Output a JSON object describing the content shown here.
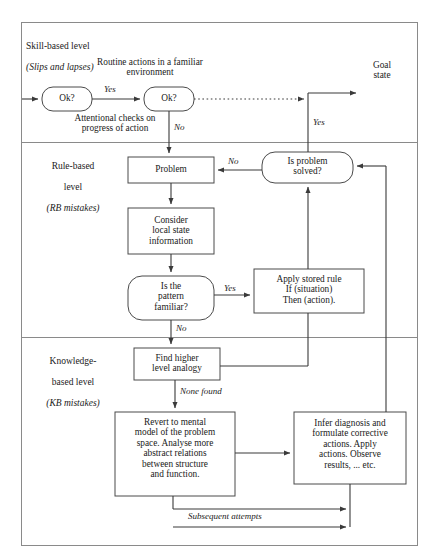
{
  "diagram": {
    "frame": {
      "stroke": "#8a8a8a"
    },
    "colors": {
      "line": "#4a4a4a",
      "box_stroke": "#4a4a4a",
      "text": "#1a1a1a",
      "background": "#ffffff"
    }
  },
  "levels": [
    {
      "id": "skill",
      "line1": "Skill-based level",
      "line2": "(Slips and lapses)"
    },
    {
      "id": "rule",
      "line1": "Rule-based",
      "line2": "level",
      "line3": "(RB mistakes)"
    },
    {
      "id": "knowledge",
      "line1": "Knowledge-",
      "line2": "based level",
      "line3": "(KB mistakes)"
    }
  ],
  "nodes": {
    "ok1": {
      "label": "Ok?",
      "shape": "rounded"
    },
    "ok2": {
      "label": "Ok?",
      "shape": "rounded"
    },
    "goal_state": {
      "label": "Goal\nstate",
      "shape": "none"
    },
    "problem": {
      "label": "Problem",
      "shape": "rect"
    },
    "is_problem_solved": {
      "label": "Is problem\nsolved?",
      "shape": "rounded"
    },
    "consider_local": {
      "label": "Consider\nlocal state\ninformation",
      "shape": "rect"
    },
    "pattern_familiar": {
      "label": "Is the\npattern\nfamiliar?",
      "shape": "rounded"
    },
    "apply_stored_rule": {
      "label": "Apply stored rule\nIf (situation)\nThen (action).",
      "shape": "rect"
    },
    "find_analogy": {
      "label": "Find higher\nlevel analogy",
      "shape": "rect"
    },
    "revert_mental_model": {
      "label": "Revert to mental\nmodel of the problem\nspace. Analyse more\nabstract relations\nbetween structure\nand function.",
      "shape": "rect"
    },
    "infer_diagnosis": {
      "label": "Infer diagnosis and\nformulate corrective\nactions. Apply\nactions. Observe\nresults, ... etc.",
      "shape": "rect"
    }
  },
  "annotations": {
    "routine_actions": "Routine actions in a familiar\nenvironment",
    "attentional_checks": "Attentional checks on\nprogress of action"
  },
  "edge_labels": {
    "ok1_ok2_yes": "Yes",
    "ok2_no": "No",
    "solved_yes": "Yes",
    "solved_no": "No",
    "pattern_yes": "Yes",
    "pattern_no": "No",
    "none_found": "None found",
    "subsequent_attempts": "Subsequent attempts"
  }
}
